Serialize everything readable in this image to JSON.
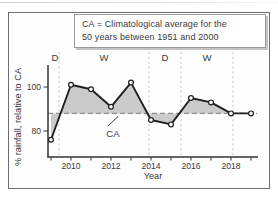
{
  "figure": {
    "legend": {
      "line1": "CA = Climatological average for the",
      "line2": "50 years between 1951 and 2000"
    },
    "ca_annotation": "CA"
  },
  "chart_data": {
    "type": "line",
    "title": "",
    "series_name": "% rainfall relative to climatological average",
    "x": [
      2009,
      2010,
      2011,
      2012,
      2013,
      2014,
      2015,
      2016,
      2017,
      2018,
      2019
    ],
    "values": [
      76,
      101,
      99,
      91,
      102,
      85,
      83,
      95,
      93,
      88,
      88
    ],
    "xlabel": "Year",
    "ylabel": "% rainfall, relative to CA",
    "y_ticks": [
      100,
      80
    ],
    "x_tick_labels": [
      2010,
      2012,
      2014,
      2016,
      2018
    ],
    "reference_line": {
      "label": "CA",
      "value_as_drawn": 88
    },
    "area_fill_meaning": "gray shading between rainfall curve and CA dashed line",
    "periods": [
      {
        "label": "D",
        "start": 2009,
        "end": 2009.4
      },
      {
        "label": "W",
        "start": 2009.4,
        "end": 2013.9
      },
      {
        "label": "D",
        "start": 2013.9,
        "end": 2015.5
      },
      {
        "label": "W",
        "start": 2015.5,
        "end": 2018.1
      }
    ],
    "period_boundaries": [
      2009.4,
      2013.9,
      2015.5,
      2018.1
    ],
    "legend_position": "top",
    "grid": false,
    "marker": "open-circle",
    "colors": {
      "line": "#1f1f1f",
      "area": "#cbcbcb",
      "ca_line": "#8f8f8f",
      "boundary_lines": "#c2c2c2",
      "axis": "#333333",
      "frame_border": "#6e6e6e"
    }
  }
}
